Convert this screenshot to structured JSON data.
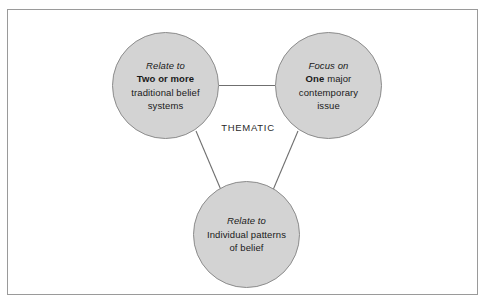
{
  "diagram": {
    "type": "triad-venn-style-diagram",
    "center_label": "THEMATIC",
    "frame": {
      "border_color": "#9a9a9a",
      "background": "#ffffff"
    },
    "style": {
      "node_fill": "#d3d3d3",
      "node_stroke": "#8c8c8c",
      "connector_color": "#6f6f6f",
      "text_color": "#1a1a1a"
    },
    "nodes": [
      {
        "id": "two-or-more",
        "position": "top-left",
        "lines": [
          {
            "text": "Relate to",
            "style": "italic"
          },
          {
            "text": "Two or more",
            "style": "bold"
          },
          {
            "text": "traditional belief",
            "style": "regular"
          },
          {
            "text": "systems",
            "style": "regular"
          }
        ]
      },
      {
        "id": "one-major",
        "position": "top-right",
        "lines": [
          {
            "text": "Focus on",
            "style": "italic"
          },
          {
            "text": "One",
            "style": "bold",
            "suffix": " major"
          },
          {
            "text": "contemporary",
            "style": "regular"
          },
          {
            "text": "issue",
            "style": "regular"
          }
        ]
      },
      {
        "id": "individual-patterns",
        "position": "bottom-center",
        "lines": [
          {
            "text": "Relate to",
            "style": "italic"
          },
          {
            "text": "Individual patterns",
            "style": "regular"
          },
          {
            "text": "of belief",
            "style": "regular"
          }
        ]
      }
    ],
    "connectors": [
      {
        "from": "two-or-more",
        "to": "one-major",
        "orientation": "horizontal"
      },
      {
        "from": "two-or-more",
        "to": "individual-patterns",
        "orientation": "diagonal"
      },
      {
        "from": "one-major",
        "to": "individual-patterns",
        "orientation": "diagonal"
      }
    ]
  }
}
